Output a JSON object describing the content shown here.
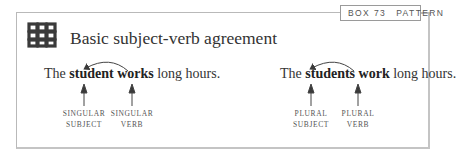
{
  "box": {
    "number_label": "BOX 73",
    "type_label": "PATTERN",
    "icon": "endless-knot-icon",
    "title": "Basic subject-verb agreement"
  },
  "examples": [
    {
      "prefix": "The ",
      "subject": "student",
      "space": " ",
      "verb": "works",
      "suffix": " long hours.",
      "subject_label_line1": "SINGULAR",
      "subject_label_line2": "SUBJECT",
      "verb_label_line1": "SINGULAR",
      "verb_label_line2": "VERB"
    },
    {
      "prefix": "The ",
      "subject": "students",
      "space": " ",
      "verb": "work",
      "suffix": " long hours.",
      "subject_label_line1": "PLURAL",
      "subject_label_line2": "SUBJECT",
      "verb_label_line1": "PLURAL",
      "verb_label_line2": "VERB"
    }
  ],
  "colors": {
    "border": "#b9b9b9",
    "text": "#333333",
    "icon": "#3a3a3a"
  }
}
